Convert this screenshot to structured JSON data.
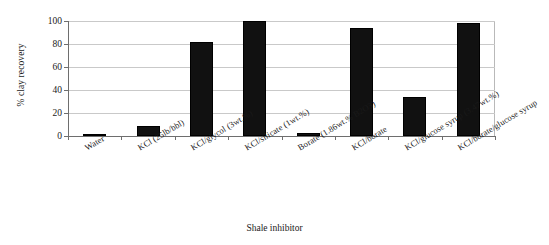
{
  "chart_data": {
    "type": "bar",
    "title": "",
    "xlabel": "Shale inhibitor",
    "ylabel": "% clay recovery",
    "ylim": [
      0,
      100
    ],
    "yticks": [
      0,
      20,
      40,
      60,
      80,
      100
    ],
    "ytick_labels": [
      "0",
      "20",
      "40",
      "60",
      "80",
      "100"
    ],
    "grid": true,
    "legend": null,
    "bar_color": "#111111",
    "bar_pattern": "dotted-fill",
    "gridline_color": "#c9c9c9",
    "axis_color": "#6e6e6e",
    "categories": [
      "Water",
      "KCl (25lb/bbl)",
      "KCl/glycol (3wt.%)",
      "KCl/silicate (1wt.%)",
      "Borate (1.86wt.% B2O3)",
      "KCl/borate",
      "KCl/glucose syrup (3.47wt.%)",
      "KCl/borate/glucose syrup"
    ],
    "values": [
      1,
      9,
      82,
      100,
      3,
      94,
      34,
      98
    ]
  }
}
